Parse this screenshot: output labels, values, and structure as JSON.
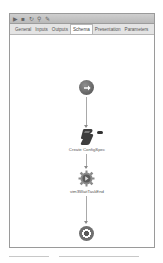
{
  "toolbar": {
    "icons": [
      {
        "name": "run-icon",
        "glyph": "▶"
      },
      {
        "name": "save-icon",
        "glyph": "■"
      },
      {
        "name": "refresh-icon",
        "glyph": "↻"
      },
      {
        "name": "search-icon",
        "glyph": "⚲"
      },
      {
        "name": "edit-icon",
        "glyph": "✎"
      }
    ]
  },
  "tabs": [
    {
      "label": "General"
    },
    {
      "label": "Inputs"
    },
    {
      "label": "Outputs"
    },
    {
      "label": "Schema",
      "active": true
    },
    {
      "label": "Presentation"
    },
    {
      "label": "Parameters"
    }
  ],
  "schema": {
    "nodes": [
      {
        "type": "start",
        "label": ""
      },
      {
        "type": "scriptable-task",
        "label": "Create ConfigSpec"
      },
      {
        "type": "workflow-element",
        "label": "vim3WaitTaskEnd"
      },
      {
        "type": "end",
        "label": ""
      }
    ]
  },
  "colors": {
    "toolbar_bg": "#c4c4c4",
    "tabs_bg": "#e4e4e4",
    "node_dark": "#4e4e4e",
    "connector": "#a9a9a9"
  }
}
